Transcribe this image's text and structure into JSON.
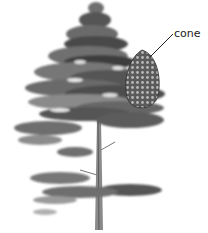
{
  "figure": {
    "labels": [
      {
        "text": "cone",
        "target": "pine cone"
      }
    ]
  },
  "colors": {
    "background": "#ffffff",
    "foliage_dark": "#3a3a3a",
    "foliage_mid": "#6e6e6e",
    "foliage_light": "#a8a8a8",
    "trunk": "#8a8a8a",
    "cone": "#4a4a4a",
    "leader_line": "#222222"
  }
}
